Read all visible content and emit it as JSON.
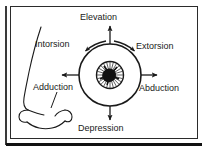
{
  "figure": {
    "background_color": "#ffffff",
    "line_color": "#1a1a1a",
    "frame_color": "#2b2b2b"
  },
  "labels": {
    "elevation": "Elevation",
    "intorsion": "Intorsion",
    "extorsion": "Extorsion",
    "adduction": "Adduction",
    "abduction": "Abduction",
    "depression": "Depression"
  },
  "parts": {
    "nose_profile": "nose-profile-outline",
    "eyeball": "eyeball-circle",
    "iris": "iris",
    "pupil": "pupil",
    "leader_line": "adduction-leader-line"
  },
  "arrows": {
    "up": "elevation-arrow-up",
    "down": "depression-arrow-down",
    "left": "adduction-arrow-left",
    "right": "abduction-arrow-right",
    "arc_left": "intorsion-arc-arrow",
    "arc_right": "extorsion-arc-arrow"
  }
}
